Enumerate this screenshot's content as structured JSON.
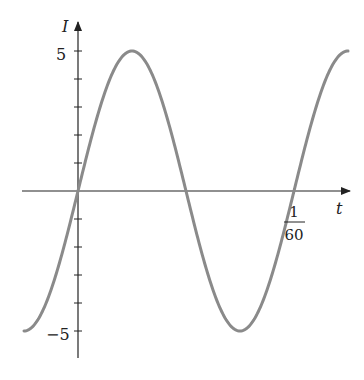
{
  "chart_data": {
    "type": "line",
    "title": "",
    "xlabel": "t",
    "ylabel": "I",
    "function": "I = 5 sin(120*pi*t)",
    "amplitude": 5,
    "period": "1/60",
    "y_ticks": [
      -5,
      -4,
      -3,
      -2,
      -1,
      1,
      2,
      3,
      4,
      5
    ],
    "y_tick_labels": [
      {
        "value": 5,
        "label": "5"
      },
      {
        "value": -5,
        "label": "−5"
      }
    ],
    "x_tick_labels": [
      {
        "value": 0.016667,
        "label_num": "1",
        "label_den": "60"
      }
    ],
    "x_range_periods": [
      -0.25,
      1.25
    ],
    "ylim": [
      -6,
      6.5
    ],
    "grid": false,
    "legend": null,
    "line_color": "#8a8a8a",
    "axis_color": "#222222"
  }
}
